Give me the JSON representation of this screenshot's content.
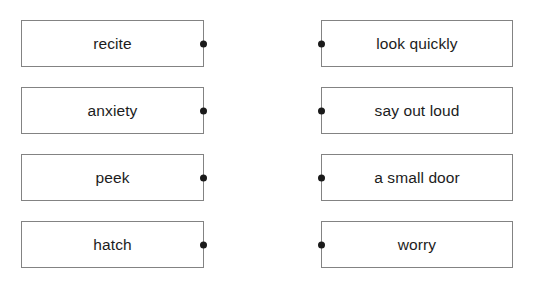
{
  "exercise": {
    "type": "matching-pairs",
    "colors": {
      "box_border": "#838383",
      "text": "#1c1c1c",
      "connector_dot": "#1a1a1a",
      "background": "#ffffff"
    },
    "left_column": {
      "items": [
        {
          "label": "recite"
        },
        {
          "label": "anxiety"
        },
        {
          "label": "peek"
        },
        {
          "label": "hatch"
        }
      ]
    },
    "right_column": {
      "items": [
        {
          "label": "look quickly"
        },
        {
          "label": "say out loud"
        },
        {
          "label": "a small door"
        },
        {
          "label": "worry"
        }
      ]
    }
  }
}
